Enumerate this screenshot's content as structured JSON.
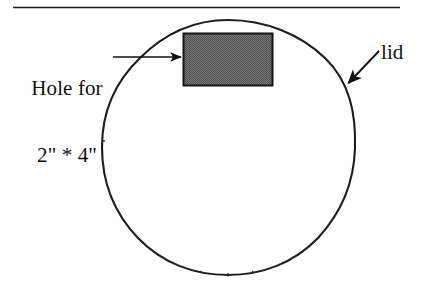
{
  "figure": {
    "background_color": "#ffffff",
    "line_color": "#1a1a1a",
    "hole_fill_color": "#6e6e6e",
    "hole_border_color": "#111111",
    "top_rule": {
      "name": "horizontal-rule",
      "x1": 13,
      "x2": 400,
      "y": 7
    },
    "circle": {
      "name": "lid-outline",
      "center_x": 228,
      "center_y": 147,
      "radius": 127,
      "stroke_width": 2
    },
    "hole_rect": {
      "name": "hole-rectangle",
      "x": 183,
      "y": 33,
      "width": 90,
      "height": 53
    }
  },
  "labels": {
    "hole": {
      "line1": "Hole for",
      "line2": "2\" * 4\""
    },
    "lid": "lid"
  },
  "annotations": {
    "hole_arrow": {
      "name": "hole-callout-arrow",
      "from_x": 113,
      "from_y": 57,
      "to_x": 182,
      "to_y": 57
    },
    "lid_arrow": {
      "name": "lid-callout-arrow",
      "from_x": 378,
      "from_y": 52,
      "to_x": 347,
      "to_y": 84
    }
  }
}
